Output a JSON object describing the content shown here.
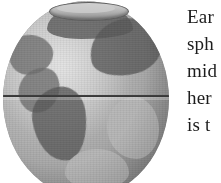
{
  "page": {
    "width": 221,
    "height": 183,
    "background_color": "#ffffff",
    "type": "scanned-book-page-fragment"
  },
  "figure": {
    "name": "globe-illustration",
    "colors": {
      "sphere_light": "#c9c9c9",
      "sphere_mid": "#9a9a9a",
      "sphere_dark": "#565656",
      "equator_line": "#3a3a3a",
      "polar_rim": "#5d5d5d"
    },
    "features": {
      "equator_label": "equator-line",
      "polar_cut_label": "polar-ellipse",
      "landmasses": [
        "north-america",
        "south-america",
        "africa",
        "eurasia",
        "northern-cap",
        "eastern-shelf",
        "southern-region"
      ]
    }
  },
  "body_text": {
    "clipped": true,
    "lines": [
      "Ear",
      "sph",
      "mid",
      "her",
      "is t"
    ]
  }
}
